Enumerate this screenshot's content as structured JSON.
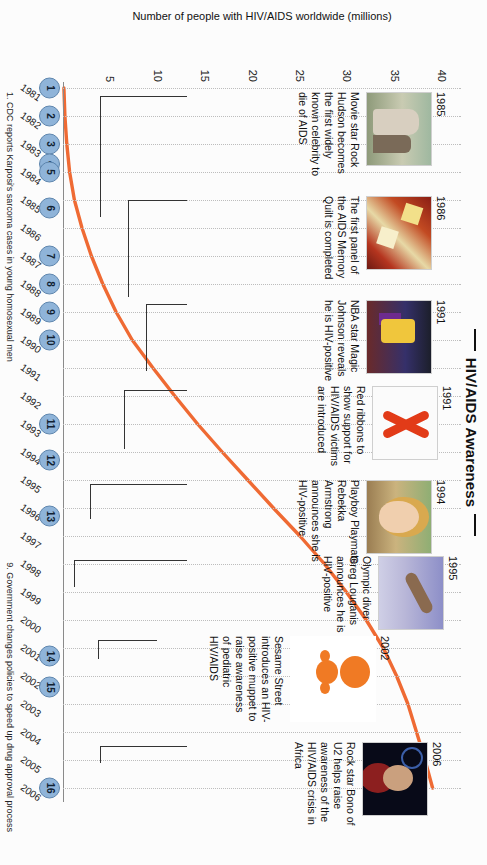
{
  "title": "HIV/AIDS Awareness",
  "chart_data": {
    "type": "line",
    "title": "HIV/AIDS Awareness",
    "xlabel": "Year of Occurrence",
    "ylabel": "Number of people with HIV/AIDS worldwide (millions)",
    "ylim": [
      0,
      42
    ],
    "yticks": [
      5,
      10,
      15,
      20,
      25,
      30,
      35,
      40
    ],
    "xlim": [
      1981,
      2006
    ],
    "grid": "vertical-dotted",
    "legend": "none",
    "line_color": "#ef6a33",
    "categories": [
      1981,
      1982,
      1983,
      1984,
      1985,
      1986,
      1987,
      1988,
      1989,
      1990,
      1991,
      1992,
      1993,
      1994,
      1995,
      1996,
      1997,
      1998,
      1999,
      2000,
      2001,
      2002,
      2003,
      2004,
      2005,
      2006
    ],
    "values": [
      0.1,
      0.2,
      0.4,
      0.7,
      1.2,
      2.0,
      3.0,
      4.2,
      5.6,
      7.3,
      9.5,
      11.8,
      14.2,
      16.8,
      19.5,
      22.2,
      25.0,
      27.6,
      29.9,
      32.0,
      33.8,
      35.2,
      36.4,
      37.3,
      38.2,
      39.0
    ],
    "xtick_labels": [
      "1981",
      "1982",
      "1983",
      "1984",
      "1985",
      "1986",
      "1987",
      "1988",
      "1989",
      "1990",
      "1991",
      "1992",
      "1993",
      "1994",
      "1995",
      "1996",
      "1997",
      "1998",
      "1999",
      "2000",
      "2001",
      "2002",
      "2003",
      "2004",
      "2005",
      "2006"
    ]
  },
  "markers": [
    {
      "n": "1",
      "year": 1981
    },
    {
      "n": "2",
      "year": 1982
    },
    {
      "n": "3",
      "year": 1983
    },
    {
      "n": "4",
      "year": 1983.7
    },
    {
      "n": "5",
      "year": 1984
    },
    {
      "n": "6",
      "year": 1985.3
    },
    {
      "n": "7",
      "year": 1987
    },
    {
      "n": "8",
      "year": 1988
    },
    {
      "n": "9",
      "year": 1989
    },
    {
      "n": "10",
      "year": 1990
    },
    {
      "n": "11",
      "year": 1993
    },
    {
      "n": "12",
      "year": 1994.3
    },
    {
      "n": "13",
      "year": 1996.3
    },
    {
      "n": "14",
      "year": 2001.3
    },
    {
      "n": "15",
      "year": 2002.4
    },
    {
      "n": "16",
      "year": 2006
    }
  ],
  "events": [
    {
      "id": "rock-hudson",
      "year": "1985",
      "photo": "p-hudson",
      "text": "Movie star Rock Hudson becomes the first widely known celebrity to die of AIDS"
    },
    {
      "id": "memory-quilt",
      "year": "1986",
      "photo": "p-quilt",
      "text": "The first panel of the AIDS Memory Quilt is completed"
    },
    {
      "id": "magic-johnson",
      "year": "1991",
      "photo": "p-magic",
      "text": "NBA star Magic Johnson reveals he is HIV-positive"
    },
    {
      "id": "red-ribbons",
      "year": "1991",
      "photo": "p-ribbon",
      "text": "Red ribbons to show support for HIV/AIDS victims are introduced"
    },
    {
      "id": "rebekka-armstrong",
      "year": "1994",
      "photo": "p-rebekka",
      "text": "Playboy Playmate Rebekka Armstrong announces she is HIV-positive"
    },
    {
      "id": "greg-louganis",
      "year": "1995",
      "photo": "p-louganis",
      "text": "Olympic diver Greg Louganis announces he is HIV-positive"
    },
    {
      "id": "sesame-street",
      "year": "2002",
      "photo": "p-kami",
      "text": "Sesame Street introduces an HIV-positive muppet to raise awareness of pediatric HIV/AIDS"
    },
    {
      "id": "bono",
      "year": "2006",
      "photo": "p-bono",
      "text": "Rock star Bono of U2 helps raise awareness of the HIV/AIDS crisis in Africa"
    }
  ],
  "footnotes": [
    "1. CDC reports Karposi's sarcoma cases in young homosexual men",
    "9. Government changes policies to speed up drug approval process"
  ]
}
